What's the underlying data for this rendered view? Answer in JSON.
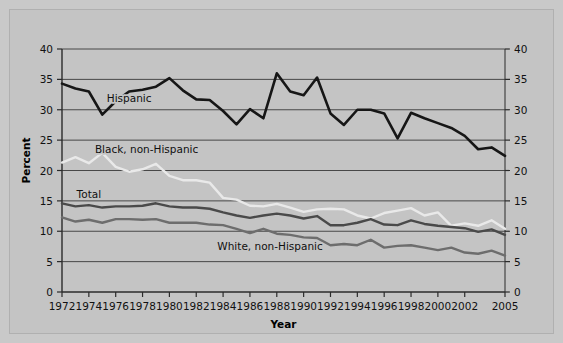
{
  "figure": {
    "background_color": "#c9c9c9",
    "plot_background_color": "#c4c4c4",
    "frame_border_color": "#b0b0b0"
  },
  "chart_data": {
    "type": "line",
    "title": "",
    "subtitle": "",
    "xlabel": "Year",
    "ylabel": "Percent",
    "xlim": [
      1972,
      2005
    ],
    "ylim": [
      0,
      40
    ],
    "grid": true,
    "grid_orientation": "horizontal",
    "legend_position": "inline-annotations",
    "y_ticks": [
      0,
      5,
      10,
      15,
      20,
      25,
      30,
      35,
      40
    ],
    "y_ticks_right": [
      0,
      5,
      10,
      15,
      20,
      25,
      30,
      35,
      40
    ],
    "x_tick_labels": [
      "1972",
      "1974",
      "1976",
      "1978",
      "1980",
      "1982",
      "1984",
      "1986",
      "1988",
      "1990",
      "1992",
      "1994",
      "1996",
      "1998",
      "2000",
      "2002",
      "2005"
    ],
    "x_tick_values": [
      1972,
      1974,
      1976,
      1978,
      1980,
      1982,
      1984,
      1986,
      1988,
      1990,
      1992,
      1994,
      1996,
      1998,
      2000,
      2002,
      2005
    ],
    "x": [
      1972,
      1973,
      1974,
      1975,
      1976,
      1977,
      1978,
      1979,
      1980,
      1981,
      1982,
      1983,
      1984,
      1985,
      1986,
      1987,
      1988,
      1989,
      1990,
      1991,
      1992,
      1993,
      1994,
      1995,
      1996,
      1997,
      1998,
      1999,
      2000,
      2001,
      2002,
      2003,
      2004,
      2005
    ],
    "series": [
      {
        "name": "Hispanic",
        "color": "#161616",
        "width": 2.6,
        "label_x": 1977.0,
        "label_y": 32.0,
        "values": [
          34.3,
          33.5,
          33.0,
          29.2,
          31.4,
          33.0,
          33.3,
          33.8,
          35.2,
          33.2,
          31.7,
          31.6,
          29.8,
          27.6,
          30.1,
          28.6,
          36.0,
          33.0,
          32.4,
          35.3,
          29.4,
          27.5,
          30.0,
          30.0,
          29.4,
          25.3,
          29.5,
          28.6,
          27.8,
          27.0,
          25.7,
          23.5,
          23.8,
          22.4
        ]
      },
      {
        "name": "Black, non-Hispanic",
        "color": "#e9e9e9",
        "width": 2.4,
        "label_x": 1978.3,
        "label_y": 23.6,
        "values": [
          21.3,
          22.2,
          21.2,
          22.9,
          20.6,
          19.8,
          20.2,
          21.1,
          19.1,
          18.4,
          18.4,
          18.0,
          15.5,
          15.2,
          14.2,
          14.1,
          14.5,
          13.9,
          13.2,
          13.6,
          13.7,
          13.6,
          12.6,
          12.1,
          13.0,
          13.4,
          13.8,
          12.6,
          13.1,
          10.9,
          11.3,
          10.9,
          11.8,
          10.4
        ]
      },
      {
        "name": "Total",
        "color": "#4a4a4a",
        "width": 2.4,
        "label_x": 1974.0,
        "label_y": 16.2,
        "values": [
          14.6,
          14.1,
          14.3,
          13.9,
          14.1,
          14.1,
          14.2,
          14.6,
          14.1,
          13.9,
          13.9,
          13.7,
          13.1,
          12.6,
          12.2,
          12.6,
          12.9,
          12.6,
          12.1,
          12.5,
          11.0,
          11.0,
          11.4,
          12.0,
          11.1,
          11.0,
          11.8,
          11.2,
          10.9,
          10.7,
          10.5,
          9.9,
          10.3,
          9.4
        ]
      },
      {
        "name": "White, non-Hispanic",
        "color": "#6d6d6d",
        "width": 2.4,
        "label_x": 1987.5,
        "label_y": 7.6,
        "values": [
          12.3,
          11.6,
          11.9,
          11.4,
          12.0,
          12.0,
          11.9,
          12.0,
          11.4,
          11.4,
          11.4,
          11.1,
          11.0,
          10.4,
          9.7,
          10.4,
          9.6,
          9.4,
          9.0,
          8.9,
          7.7,
          7.9,
          7.7,
          8.6,
          7.3,
          7.6,
          7.7,
          7.3,
          6.9,
          7.3,
          6.5,
          6.3,
          6.8,
          6.0
        ]
      }
    ]
  }
}
